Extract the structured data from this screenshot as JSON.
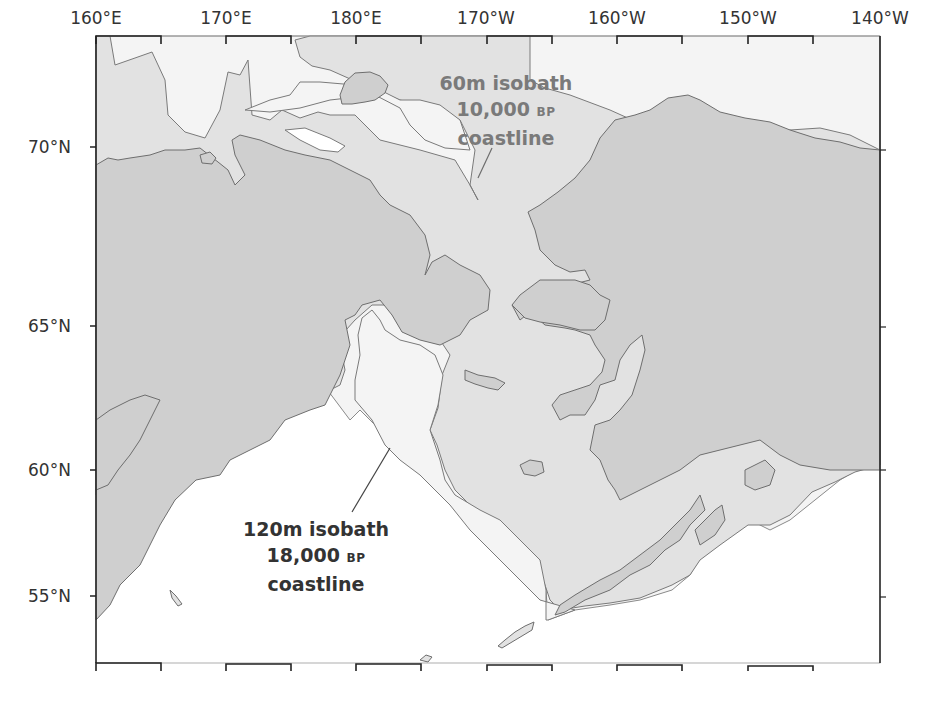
{
  "map": {
    "title": "Beringia paleo-coastlines",
    "longitude_ticks": [
      "160°E",
      "170°E",
      "180°E",
      "170°W",
      "160°W",
      "150°W",
      "140°W"
    ],
    "latitude_ticks": [
      "70°N",
      "65°N",
      "60°N",
      "55°N"
    ],
    "annotations": {
      "isobath_60": {
        "line1": "60m isobath",
        "line2_number": "10,000",
        "line2_unit": "BP",
        "line3": "coastline"
      },
      "isobath_120": {
        "line1": "120m isobath",
        "line2_number": "18,000",
        "line2_unit": "BP",
        "line3": "coastline"
      }
    },
    "colors": {
      "modern_land": "#cfcfcf",
      "shelf_exposed_60m": "#e2e2e2",
      "shelf_exposed_120m": "#f4f4f4",
      "ocean": "#ffffff",
      "coastline_stroke": "#6e6e6e",
      "frame": "#222222",
      "label_60m": "#7a7a7a",
      "label_120m": "#333333"
    },
    "layers": [
      "modern land",
      "shelf exposed at 60m isobath (10,000 BP)",
      "shelf exposed at 120m isobath (18,000 BP)",
      "ocean"
    ]
  }
}
